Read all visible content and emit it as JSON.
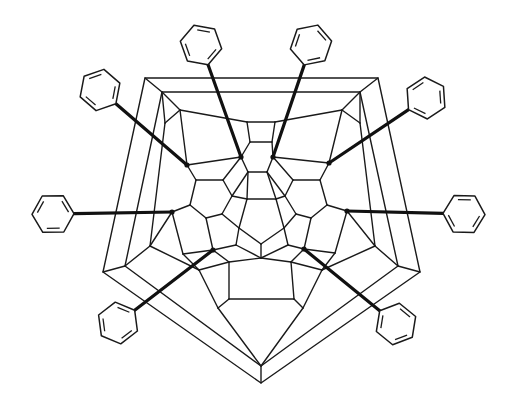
{
  "figure": {
    "description": "Schlegel diagram of a fullerene cage bearing ten phenyl substituents",
    "cage_type": "fullerene Schlegel projection (pentagonal outer frame)",
    "substituent": "phenyl",
    "substituent_count": 10,
    "colors": {
      "line": "#1a1a1a",
      "background": "#ffffff"
    }
  },
  "cage": {
    "outer_pentagon": [
      [
        261,
        383
      ],
      [
        103,
        272
      ],
      [
        145,
        78
      ],
      [
        378,
        78
      ],
      [
        420,
        272
      ]
    ],
    "second_pentagon": [
      [
        261,
        366
      ],
      [
        125,
        266
      ],
      [
        162,
        92
      ],
      [
        360,
        92
      ],
      [
        398,
        266
      ]
    ],
    "central_pentagon": [
      [
        247,
        199
      ],
      [
        276,
        199
      ],
      [
        284,
        228
      ],
      [
        261,
        244
      ],
      [
        239,
        228
      ]
    ]
  },
  "phenyls": [
    {
      "id": "ph1",
      "attach": [
        241,
        157
      ],
      "ring_center": [
        201,
        45
      ],
      "bond_end": [
        210,
        68
      ]
    },
    {
      "id": "ph2",
      "attach": [
        273,
        157
      ],
      "ring_center": [
        311,
        45
      ],
      "bond_end": [
        302,
        68
      ]
    },
    {
      "id": "ph3",
      "attach": [
        187,
        165
      ],
      "ring_center": [
        100,
        90
      ],
      "bond_end": [
        118,
        102
      ]
    },
    {
      "id": "ph4",
      "attach": [
        329,
        163
      ],
      "ring_center": [
        426,
        98
      ],
      "bond_end": [
        409,
        112
      ]
    },
    {
      "id": "ph5",
      "attach": [
        172,
        212
      ],
      "ring_center": [
        53,
        214
      ],
      "bond_end": [
        76,
        213
      ]
    },
    {
      "id": "ph6",
      "attach": [
        347,
        211
      ],
      "ring_center": [
        464,
        214
      ],
      "bond_end": [
        443,
        213
      ]
    },
    {
      "id": "ph7",
      "attach": [
        213,
        250
      ],
      "ring_center": [
        118,
        323
      ],
      "bond_end": [
        137,
        308
      ]
    },
    {
      "id": "ph8",
      "attach": [
        304,
        249
      ],
      "ring_center": [
        396,
        324
      ],
      "bond_end": [
        377,
        308
      ]
    }
  ]
}
